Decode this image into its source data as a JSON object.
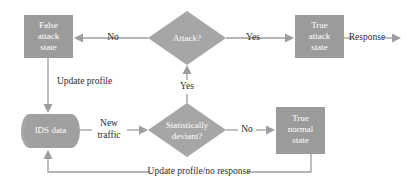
{
  "diagram": {
    "colors": {
      "box_fill": "#9b9b9b",
      "diamond_fill": "#a6a6a6",
      "cylinder_fill": "#a0a0a0",
      "connector": "#9d9d9d",
      "node_text": "#ffffff",
      "edge_text": "#2b2b2b",
      "background": "#ffffff"
    },
    "nodes": [
      {
        "id": "false-attack-state",
        "type": "process-box",
        "lines": [
          "False",
          "attack",
          "state"
        ]
      },
      {
        "id": "attack-decision",
        "type": "decision-diamond",
        "lines": [
          "Attack?"
        ]
      },
      {
        "id": "true-attack-state",
        "type": "process-box",
        "lines": [
          "True",
          "attack",
          "state"
        ]
      },
      {
        "id": "ids-data",
        "type": "database-cylinder",
        "lines": [
          "IDS data"
        ]
      },
      {
        "id": "statistically-deviant-decision",
        "type": "decision-diamond",
        "lines": [
          "Statistically",
          "deviant?"
        ]
      },
      {
        "id": "true-normal-state",
        "type": "process-box",
        "lines": [
          "True",
          "normal",
          "state"
        ]
      }
    ],
    "edge_labels": {
      "attack_no": "No",
      "attack_yes": "Yes",
      "response": "Response",
      "update_profile": "Update profile",
      "new_traffic_line1": "New",
      "new_traffic_line2": "traffic",
      "deviant_yes": "Yes",
      "deviant_no": "No",
      "update_profile_no_response": "Update profile/no response"
    }
  }
}
